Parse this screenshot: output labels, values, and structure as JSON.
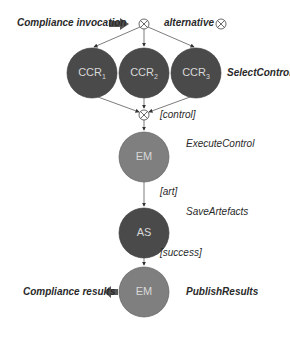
{
  "colors": {
    "dark_node": "#4a4a4a",
    "mid_node": "#7f7f7f",
    "line": "#3a3a3a",
    "text_on_node": "#dcdcdc"
  },
  "labels": {
    "invocation": "Compliance invocation",
    "alternative": "alternative",
    "select_control": "SelectControl",
    "control_guard": "[control]",
    "execute_control": "ExecuteControl",
    "art_guard": "[art]",
    "save_artefacts": "SaveArtefacts",
    "success_guard": "[success]",
    "publish_results": "PublishResults",
    "results": "Compliance results"
  },
  "nodes": {
    "ccr1": {
      "base": "CCR",
      "sub": "1"
    },
    "ccr2": {
      "base": "CCR",
      "sub": "2"
    },
    "ccr3": {
      "base": "CCR",
      "sub": "3"
    },
    "em1": "EM",
    "as": "AS",
    "em2": "EM"
  },
  "legend": {
    "xor_icon": "alternative-gateway-icon"
  }
}
